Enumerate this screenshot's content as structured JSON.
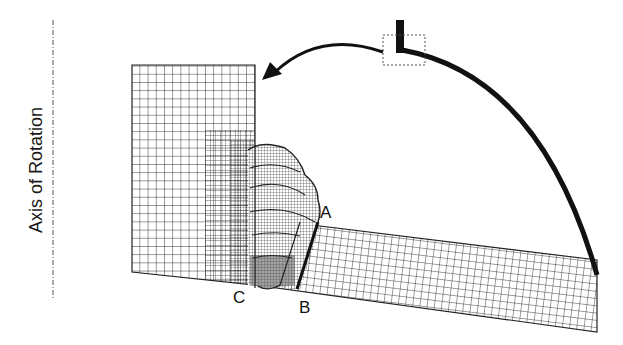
{
  "diagram": {
    "axis_label": "Axis of Rotation",
    "point_labels": {
      "a": "A",
      "b": "B",
      "c": "C"
    },
    "colors": {
      "mesh_line": "#222222",
      "arc": "#111111",
      "dashed": "#555555",
      "background": "#ffffff"
    },
    "elements": [
      "axis-of-rotation dashed line",
      "finite element mesh: vertical block",
      "finite element mesh: weld bead (refined)",
      "finite element mesh: inclined plate",
      "section line A-B",
      "rotation arc with L-shaped cross-section",
      "dashed inset box",
      "curved arrow pointing to mesh"
    ]
  }
}
